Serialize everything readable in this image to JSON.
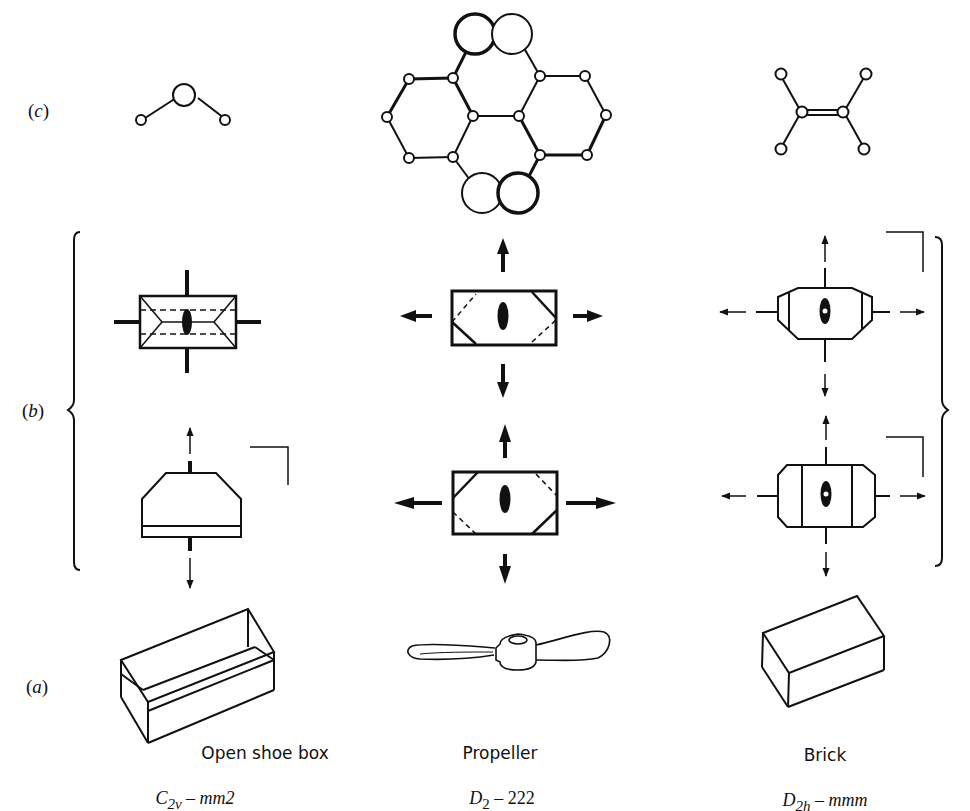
{
  "figure": {
    "rows": [
      {
        "id": "c",
        "label": "c",
        "description": "Molecule examples"
      },
      {
        "id": "b",
        "label": "b",
        "description": "Stereographic-style symmetry element diagrams"
      },
      {
        "id": "a",
        "label": "a",
        "description": "Everyday object examples"
      }
    ],
    "columns": [
      {
        "object_name": "Open shoe box",
        "schoenflies_main": "C",
        "schoenflies_sub": "2v",
        "separator": "–",
        "hermann_mauguin": "mm2",
        "molecule": "bent triatomic (water-like)"
      },
      {
        "object_name": "Propeller",
        "schoenflies_main": "D",
        "schoenflies_sub": "2",
        "separator": "–",
        "hermann_mauguin": "222",
        "molecule": "twisted polycyclic with four large atoms"
      },
      {
        "object_name": "Brick",
        "schoenflies_main": "D",
        "schoenflies_sub": "2h",
        "separator": "–",
        "hermann_mauguin": "mmm",
        "molecule": "planar ethylene-like"
      }
    ],
    "colors": {
      "ink": "#111111",
      "background": "#ffffff"
    }
  }
}
